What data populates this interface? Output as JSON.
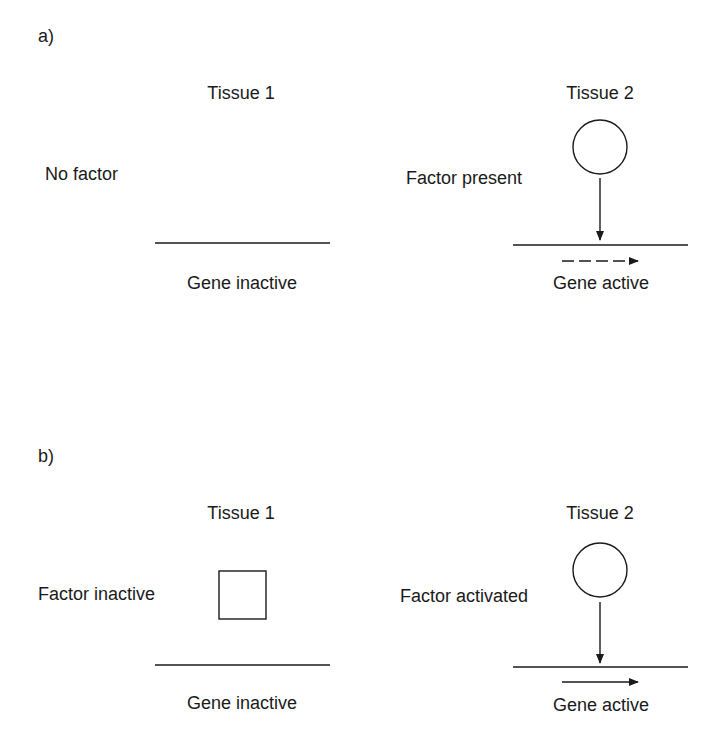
{
  "panels": [
    {
      "label": "a)",
      "tissue1": {
        "title": "Tissue 1",
        "factor_label": "No factor",
        "factor_shape": "none",
        "gene_label": "Gene inactive"
      },
      "tissue2": {
        "title": "Tissue 2",
        "factor_label": "Factor present",
        "factor_shape": "circle",
        "transcription_arrow": "dashed",
        "gene_label": "Gene active"
      }
    },
    {
      "label": "b)",
      "tissue1": {
        "title": "Tissue 1",
        "factor_label": "Factor inactive",
        "factor_shape": "square",
        "gene_label": "Gene inactive"
      },
      "tissue2": {
        "title": "Tissue 2",
        "factor_label": "Factor activated",
        "factor_shape": "circle",
        "transcription_arrow": "solid",
        "gene_label": "Gene active"
      }
    }
  ],
  "colors": {
    "ink": "#1a1a1a",
    "background": "#ffffff"
  }
}
